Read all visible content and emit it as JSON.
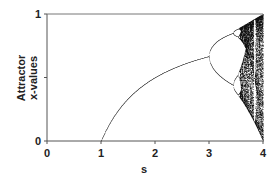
{
  "chart_data": {
    "type": "scatter",
    "title": "",
    "xlabel": "s",
    "ylabel_lines": [
      "Attractor",
      "x-values"
    ],
    "xlim": [
      0,
      4
    ],
    "ylim": [
      0,
      1
    ],
    "x_ticks": [
      {
        "value": 0,
        "label": "0"
      },
      {
        "value": 1,
        "label": "1"
      },
      {
        "value": 2,
        "label": "2"
      },
      {
        "value": 3,
        "label": "3"
      },
      {
        "value": 4,
        "label": "4"
      }
    ],
    "y_ticks": [
      {
        "value": 0,
        "label": "0"
      },
      {
        "value": 0.5,
        "label": ""
      },
      {
        "value": 1,
        "label": "1"
      }
    ],
    "grid": false,
    "legend": null,
    "series": [
      {
        "name": "attractor",
        "rule": "x_{n+1} = s * x_n * (1 - x_n)",
        "s_start": 1.0,
        "s_end": 4.0,
        "points_summary": [
          {
            "s": 1.0,
            "x": 0.0
          },
          {
            "s": 2.0,
            "x": 0.5
          },
          {
            "s": 3.0,
            "x": 0.667
          },
          {
            "s": 3.45,
            "x": [
              0.44,
              0.85
            ]
          },
          {
            "s": 3.57,
            "x": "onset of chaos"
          },
          {
            "s": 4.0,
            "x": [
              0.0,
              1.0
            ]
          }
        ]
      }
    ],
    "colors": {
      "axis": "#555555",
      "points": "#111111",
      "background": "#ffffff"
    }
  }
}
